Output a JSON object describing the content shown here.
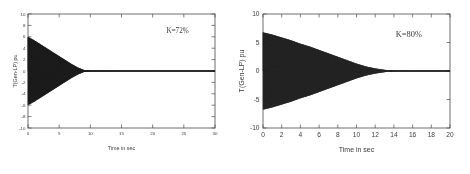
{
  "figure": {
    "background_color": "#ffffff",
    "trace_color": "#1a1a1a",
    "axis_color": "#4a4a4a",
    "text_color": "#3a3a3a"
  },
  "chart_data": [
    {
      "type": "line",
      "title": "",
      "panel_id": "left",
      "xlabel": "Time in sec",
      "ylabel": "T(Gen-LP) pu",
      "annotation": "K=72%",
      "xlim": [
        0,
        30
      ],
      "ylim": [
        -10,
        10
      ],
      "xticks": [
        0,
        5,
        10,
        15,
        20,
        25,
        30
      ],
      "xticklabels": [
        "0",
        "5",
        "10",
        "15",
        "20",
        "25",
        "30"
      ],
      "yticks": [
        -10,
        -8,
        -6,
        -4,
        -2,
        0,
        2,
        4,
        6,
        8,
        10
      ],
      "yticklabels": [
        "-10",
        "-8",
        "-6",
        "-4",
        "-2",
        "0",
        "2",
        "4",
        "6",
        "8",
        "10"
      ],
      "grid": false,
      "legend": "none",
      "description": "Damped oscillatory torque, high-frequency oscillation with exponentially decaying envelope",
      "envelope": {
        "t0_amplitude": 6.0,
        "settle_time_sec": 9.0,
        "decay_model": "exponential",
        "final_value": 0.0,
        "oscillation_frequency_hz": 22
      },
      "envelope_points": [
        {
          "t": 0.0,
          "amp": 6.0
        },
        {
          "t": 1.0,
          "amp": 5.4
        },
        {
          "t": 2.0,
          "amp": 4.7
        },
        {
          "t": 3.0,
          "amp": 4.0
        },
        {
          "t": 4.0,
          "amp": 3.3
        },
        {
          "t": 5.0,
          "amp": 2.6
        },
        {
          "t": 6.0,
          "amp": 1.9
        },
        {
          "t": 7.0,
          "amp": 1.2
        },
        {
          "t": 8.0,
          "amp": 0.6
        },
        {
          "t": 9.0,
          "amp": 0.15
        },
        {
          "t": 10.0,
          "amp": 0.06
        },
        {
          "t": 15.0,
          "amp": 0.04
        },
        {
          "t": 20.0,
          "amp": 0.04
        },
        {
          "t": 25.0,
          "amp": 0.04
        },
        {
          "t": 30.0,
          "amp": 0.04
        }
      ]
    },
    {
      "type": "line",
      "title": "",
      "panel_id": "right",
      "xlabel": "Time in sec",
      "ylabel": "T(Gen-LP) pu",
      "annotation": "K=80%",
      "xlim": [
        0,
        20
      ],
      "ylim": [
        -10,
        10
      ],
      "xticks": [
        0,
        2,
        4,
        6,
        8,
        10,
        12,
        14,
        16,
        18,
        20
      ],
      "xticklabels": [
        "0",
        "2",
        "4",
        "6",
        "8",
        "10",
        "12",
        "14",
        "16",
        "18",
        "20"
      ],
      "yticks": [
        -10,
        -5,
        0,
        5,
        10
      ],
      "yticklabels": [
        "-10",
        "-5",
        "0",
        "5",
        "10"
      ],
      "grid": false,
      "legend": "none",
      "description": "Damped oscillatory torque, high-frequency oscillation with exponentially decaying envelope, slower decay than K=72% case",
      "envelope": {
        "t0_amplitude": 6.8,
        "settle_time_sec": 13.5,
        "decay_model": "exponential",
        "final_value": 0.0,
        "oscillation_frequency_hz": 22
      },
      "envelope_points": [
        {
          "t": 0.0,
          "amp": 6.8
        },
        {
          "t": 1.0,
          "amp": 6.4
        },
        {
          "t": 2.0,
          "amp": 5.9
        },
        {
          "t": 3.0,
          "amp": 5.4
        },
        {
          "t": 4.0,
          "amp": 4.8
        },
        {
          "t": 5.0,
          "amp": 4.3
        },
        {
          "t": 6.0,
          "amp": 3.7
        },
        {
          "t": 7.0,
          "amp": 3.1
        },
        {
          "t": 8.0,
          "amp": 2.5
        },
        {
          "t": 9.0,
          "amp": 1.9
        },
        {
          "t": 10.0,
          "amp": 1.3
        },
        {
          "t": 11.0,
          "amp": 0.8
        },
        {
          "t": 12.0,
          "amp": 0.45
        },
        {
          "t": 13.0,
          "amp": 0.2
        },
        {
          "t": 13.5,
          "amp": 0.12
        },
        {
          "t": 14.0,
          "amp": 0.06
        },
        {
          "t": 16.0,
          "amp": 0.05
        },
        {
          "t": 18.0,
          "amp": 0.05
        },
        {
          "t": 20.0,
          "amp": 0.05
        }
      ]
    }
  ]
}
